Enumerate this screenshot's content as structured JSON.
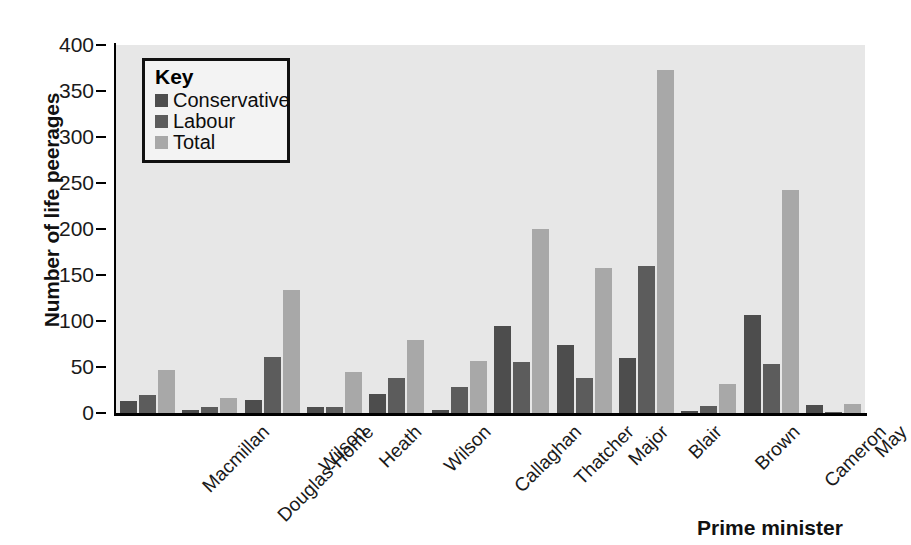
{
  "chart_data": {
    "type": "bar",
    "title": "",
    "xlabel": "Prime minister",
    "ylabel": "Number of life peerages",
    "ylim": [
      0,
      400
    ],
    "ytick_step": 50,
    "yticks": [
      0,
      50,
      100,
      150,
      200,
      250,
      300,
      350,
      400
    ],
    "grid": false,
    "legend_position": "top-left-inside",
    "legend_title": "Key",
    "categories": [
      "Macmillan",
      "Douglas-Home",
      "Wilson",
      "Heath",
      "Wilson",
      "Callaghan",
      "Thatcher",
      "Major",
      "Blair",
      "Brown",
      "Cameron",
      "May"
    ],
    "series": [
      {
        "name": "Conservative",
        "color": "#4d4d4d",
        "values": [
          13,
          3,
          14,
          7,
          21,
          3,
          95,
          74,
          60,
          2,
          107,
          9
        ]
      },
      {
        "name": "Labour",
        "color": "#5c5c5c",
        "values": [
          20,
          7,
          61,
          7,
          38,
          28,
          55,
          38,
          160,
          8,
          53,
          1
        ]
      },
      {
        "name": "Total",
        "color": "#a8a8a8",
        "values": [
          47,
          16,
          134,
          45,
          79,
          57,
          200,
          158,
          373,
          31,
          242,
          10
        ]
      }
    ]
  },
  "style": {
    "plot_background": "#e7e7e7",
    "axis_color": "#000000",
    "text_color": "#1a1a1a",
    "legend_background": "#f3f3f3",
    "legend_border": "#111111"
  }
}
